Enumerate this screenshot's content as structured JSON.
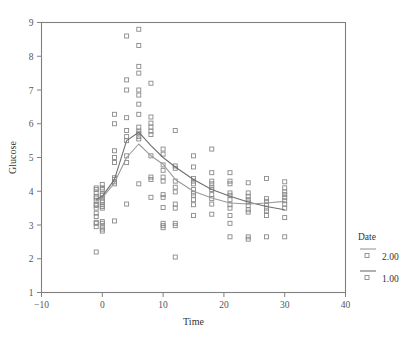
{
  "chart_data": {
    "type": "scatter",
    "title": "",
    "xlabel": "Time",
    "ylabel": "Glucose",
    "xlim": [
      -10,
      40
    ],
    "ylim": [
      1,
      9
    ],
    "xticks": [
      -10,
      0,
      10,
      20,
      30,
      40
    ],
    "xtick_labels": [
      "−10",
      "0",
      "10",
      "20",
      "30",
      "40"
    ],
    "yticks": [
      1,
      2,
      3,
      4,
      5,
      6,
      7,
      8,
      9
    ],
    "ytick_labels": [
      "1",
      "2",
      "3",
      "4",
      "5",
      "6",
      "7",
      "8",
      "9"
    ],
    "grid": false,
    "frame": "box",
    "marker": "open-square",
    "marker_size": 4,
    "colors": {
      "series_1_line": "#6f6f6f",
      "series_2_line": "#9a9a9a",
      "marker_stroke": "#8a8a8a",
      "axis": "#808080",
      "text": "#3c3c3c"
    },
    "legend": {
      "title": "Date",
      "position": "right",
      "entries": [
        {
          "label": "2.00",
          "line_color": "#9a9a9a",
          "marker": "open-square"
        },
        {
          "label": "1.00",
          "line_color": "#6f6f6f",
          "marker": "open-square"
        }
      ]
    },
    "series": [
      {
        "name": "2.00",
        "type": "line",
        "color": "#6f6f6f",
        "x": [
          -1,
          0,
          2,
          4,
          6,
          8,
          10,
          12,
          15,
          18,
          21,
          24,
          27,
          30
        ],
        "values": [
          3.75,
          3.85,
          4.35,
          5.5,
          5.75,
          5.35,
          5.0,
          4.72,
          4.35,
          4.05,
          3.85,
          3.68,
          3.55,
          3.45
        ]
      },
      {
        "name": "1.00",
        "type": "line",
        "color": "#9a9a9a",
        "x": [
          -1,
          0,
          2,
          4,
          6,
          8,
          10,
          12,
          15,
          18,
          21,
          24,
          27,
          30
        ],
        "values": [
          3.72,
          3.8,
          4.25,
          5.0,
          5.4,
          5.05,
          4.8,
          4.35,
          4.0,
          3.8,
          3.65,
          3.62,
          3.65,
          3.7
        ]
      }
    ],
    "points": [
      [
        -1,
        4.1
      ],
      [
        -1,
        4.05
      ],
      [
        -1,
        3.95
      ],
      [
        -1,
        3.85
      ],
      [
        -1,
        3.8
      ],
      [
        -1,
        3.72
      ],
      [
        -1,
        3.62
      ],
      [
        -1,
        3.58
      ],
      [
        -1,
        3.5
      ],
      [
        -1,
        3.35
      ],
      [
        -1,
        3.25
      ],
      [
        -1,
        3.08
      ],
      [
        -1,
        3.05
      ],
      [
        -1,
        2.95
      ],
      [
        -1,
        2.2
      ],
      [
        0,
        4.2
      ],
      [
        0,
        4.1
      ],
      [
        0,
        4.05
      ],
      [
        0,
        3.92
      ],
      [
        0,
        3.88
      ],
      [
        0,
        3.8
      ],
      [
        0,
        3.72
      ],
      [
        0,
        3.68
      ],
      [
        0,
        3.6
      ],
      [
        0,
        3.55
      ],
      [
        0,
        3.5
      ],
      [
        0,
        3.1
      ],
      [
        0,
        3.05
      ],
      [
        0,
        2.95
      ],
      [
        0,
        2.88
      ],
      [
        0,
        2.82
      ],
      [
        2,
        6.28
      ],
      [
        2,
        6.0
      ],
      [
        2,
        5.2
      ],
      [
        2,
        5.0
      ],
      [
        2,
        4.85
      ],
      [
        2,
        4.4
      ],
      [
        2,
        4.35
      ],
      [
        2,
        4.28
      ],
      [
        2,
        4.22
      ],
      [
        2,
        3.12
      ],
      [
        4,
        8.6
      ],
      [
        4,
        7.3
      ],
      [
        4,
        7.0
      ],
      [
        4,
        6.18
      ],
      [
        4,
        5.8
      ],
      [
        4,
        5.62
      ],
      [
        4,
        5.5
      ],
      [
        4,
        5.05
      ],
      [
        4,
        4.85
      ],
      [
        4,
        3.62
      ],
      [
        6,
        8.8
      ],
      [
        6,
        8.32
      ],
      [
        6,
        7.7
      ],
      [
        6,
        7.5
      ],
      [
        6,
        7.0
      ],
      [
        6,
        6.85
      ],
      [
        6,
        6.58
      ],
      [
        6,
        6.28
      ],
      [
        6,
        5.9
      ],
      [
        6,
        5.78
      ],
      [
        6,
        5.72
      ],
      [
        6,
        5.62
      ],
      [
        6,
        5.55
      ],
      [
        6,
        4.22
      ],
      [
        8,
        7.2
      ],
      [
        8,
        6.2
      ],
      [
        8,
        6.02
      ],
      [
        8,
        5.9
      ],
      [
        8,
        5.78
      ],
      [
        8,
        5.68
      ],
      [
        8,
        5.05
      ],
      [
        8,
        4.42
      ],
      [
        8,
        4.35
      ],
      [
        8,
        3.82
      ],
      [
        10,
        5.25
      ],
      [
        10,
        5.1
      ],
      [
        10,
        4.78
      ],
      [
        10,
        4.62
      ],
      [
        10,
        4.42
      ],
      [
        10,
        4.3
      ],
      [
        10,
        3.9
      ],
      [
        10,
        3.82
      ],
      [
        10,
        3.52
      ],
      [
        10,
        3.05
      ],
      [
        10,
        2.98
      ],
      [
        10,
        2.92
      ],
      [
        12,
        5.8
      ],
      [
        12,
        4.75
      ],
      [
        12,
        4.68
      ],
      [
        12,
        4.3
      ],
      [
        12,
        4.12
      ],
      [
        12,
        3.98
      ],
      [
        12,
        3.62
      ],
      [
        12,
        3.5
      ],
      [
        12,
        3.05
      ],
      [
        12,
        2.98
      ],
      [
        12,
        2.05
      ],
      [
        15,
        5.05
      ],
      [
        15,
        4.72
      ],
      [
        15,
        4.38
      ],
      [
        15,
        4.3
      ],
      [
        15,
        4.22
      ],
      [
        15,
        4.05
      ],
      [
        15,
        3.95
      ],
      [
        15,
        3.88
      ],
      [
        15,
        3.75
      ],
      [
        15,
        3.6
      ],
      [
        15,
        3.28
      ],
      [
        18,
        5.25
      ],
      [
        18,
        4.55
      ],
      [
        18,
        4.3
      ],
      [
        18,
        4.22
      ],
      [
        18,
        4.12
      ],
      [
        18,
        4.05
      ],
      [
        18,
        3.9
      ],
      [
        18,
        3.78
      ],
      [
        18,
        3.62
      ],
      [
        18,
        3.32
      ],
      [
        21,
        4.55
      ],
      [
        21,
        4.3
      ],
      [
        21,
        4.22
      ],
      [
        21,
        3.95
      ],
      [
        21,
        3.88
      ],
      [
        21,
        3.75
      ],
      [
        21,
        3.6
      ],
      [
        21,
        3.5
      ],
      [
        21,
        3.28
      ],
      [
        21,
        3.05
      ],
      [
        21,
        2.65
      ],
      [
        24,
        4.25
      ],
      [
        24,
        3.95
      ],
      [
        24,
        3.85
      ],
      [
        24,
        3.75
      ],
      [
        24,
        3.68
      ],
      [
        24,
        3.58
      ],
      [
        24,
        3.45
      ],
      [
        24,
        3.38
      ],
      [
        24,
        2.65
      ],
      [
        24,
        2.58
      ],
      [
        27,
        4.38
      ],
      [
        27,
        3.78
      ],
      [
        27,
        3.7
      ],
      [
        27,
        3.6
      ],
      [
        27,
        3.5
      ],
      [
        27,
        3.42
      ],
      [
        27,
        3.28
      ],
      [
        27,
        2.65
      ],
      [
        30,
        4.28
      ],
      [
        30,
        4.1
      ],
      [
        30,
        3.98
      ],
      [
        30,
        3.9
      ],
      [
        30,
        3.82
      ],
      [
        30,
        3.72
      ],
      [
        30,
        3.62
      ],
      [
        30,
        3.5
      ],
      [
        30,
        3.22
      ],
      [
        30,
        2.65
      ]
    ]
  }
}
